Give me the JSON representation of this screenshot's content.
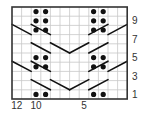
{
  "chart_data": {
    "type": "knitting-chart",
    "title": "",
    "columns": 12,
    "rows": 10,
    "col_labels": [
      {
        "col": 12,
        "text": "12"
      },
      {
        "col": 10,
        "text": "10"
      },
      {
        "col": 5,
        "text": "5"
      }
    ],
    "row_labels": [
      {
        "row": 1,
        "text": "1"
      },
      {
        "row": 3,
        "text": "3"
      },
      {
        "row": 5,
        "text": "5"
      },
      {
        "row": 7,
        "text": "7"
      },
      {
        "row": 9,
        "text": "9"
      }
    ],
    "symbols": {
      "purl_dot": [
        {
          "row": 10,
          "cols": [
            10,
            9,
            4,
            3
          ]
        },
        {
          "row": 9,
          "cols": [
            10,
            9,
            4,
            3
          ]
        },
        {
          "row": 8,
          "cols": [
            10,
            9,
            4,
            3
          ]
        },
        {
          "row": 5,
          "cols": [
            10,
            9,
            4,
            3
          ]
        },
        {
          "row": 4,
          "cols": [
            10,
            9,
            4,
            3
          ]
        },
        {
          "row": 1,
          "cols": [
            10,
            9,
            4,
            3
          ]
        }
      ],
      "cable_left_down": [
        {
          "row": 8,
          "cols": [
            12,
            11
          ]
        },
        {
          "row": 8,
          "cols": [
            10,
            9
          ]
        },
        {
          "row": 6,
          "cols": [
            10,
            9
          ]
        },
        {
          "row": 6,
          "cols": [
            8,
            7
          ]
        },
        {
          "row": 4,
          "cols": [
            12,
            11
          ]
        },
        {
          "row": 4,
          "cols": [
            10,
            9
          ]
        },
        {
          "row": 2,
          "cols": [
            10,
            9
          ]
        },
        {
          "row": 2,
          "cols": [
            8,
            7
          ]
        }
      ],
      "cable_right_up": [
        {
          "row": 8,
          "cols": [
            4,
            3
          ]
        },
        {
          "row": 8,
          "cols": [
            2,
            1
          ]
        },
        {
          "row": 6,
          "cols": [
            6,
            5
          ]
        },
        {
          "row": 6,
          "cols": [
            4,
            3
          ]
        },
        {
          "row": 4,
          "cols": [
            4,
            3
          ]
        },
        {
          "row": 4,
          "cols": [
            2,
            1
          ]
        },
        {
          "row": 2,
          "cols": [
            6,
            5
          ]
        },
        {
          "row": 2,
          "cols": [
            4,
            3
          ]
        }
      ]
    },
    "colors": {
      "grid": "#c8c8c8",
      "border": "#333333",
      "symbol": "#111111",
      "label": "#333333"
    }
  }
}
